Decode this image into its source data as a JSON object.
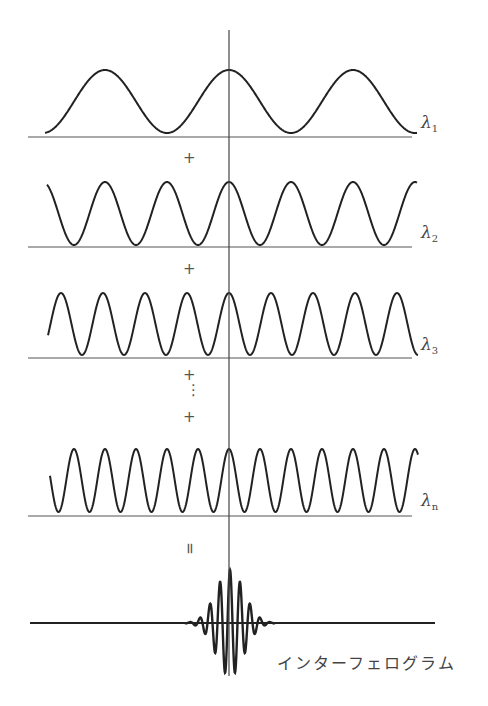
{
  "diagram": {
    "center_line_x": 229,
    "waves": [
      {
        "label_symbol": "λ",
        "label_sub": "1",
        "baseline_y": 137,
        "peak_y": 70,
        "trough_y": 133,
        "x_start": 45,
        "x_end": 417,
        "period": 124
      },
      {
        "label_symbol": "λ",
        "label_sub": "2",
        "baseline_y": 247,
        "peak_y": 182,
        "trough_y": 245,
        "x_start": 47,
        "x_end": 417,
        "period": 62
      },
      {
        "label_symbol": "λ",
        "label_sub": "3",
        "baseline_y": 358,
        "peak_y": 293,
        "trough_y": 355,
        "x_start": 48,
        "x_end": 418,
        "period": 42
      },
      {
        "label_symbol": "λ",
        "label_sub": "n",
        "baseline_y": 516,
        "peak_y": 449,
        "trough_y": 512,
        "x_start": 50,
        "x_end": 418,
        "period": 31
      }
    ],
    "operators": [
      {
        "symbol": "+",
        "x": 175,
        "y": 158
      },
      {
        "symbol": "+",
        "x": 175,
        "y": 269
      },
      {
        "symbol": "+",
        "x": 175,
        "y": 376
      },
      {
        "symbol": "⋮",
        "x": 177,
        "y": 390
      },
      {
        "symbol": "+",
        "x": 175,
        "y": 414
      },
      {
        "symbol": "=",
        "x": 176,
        "y": 542
      }
    ],
    "interferogram": {
      "baseline_y": 623,
      "x_start": 30,
      "x_end": 435,
      "burst_center_x": 230,
      "caption": "インターフェログラム"
    }
  }
}
